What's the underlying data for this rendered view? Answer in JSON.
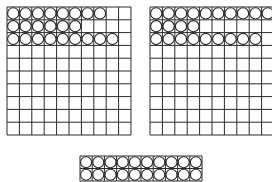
{
  "colors": {
    "line": "#2a2a2a",
    "circle_fill": "#ffffff",
    "background": "#ffffff"
  },
  "grids": [
    {
      "name": "left-hundred-grid",
      "x": 6,
      "y": 6,
      "cols": 10,
      "rows": 10,
      "cell_w": 12.4,
      "cell_h": 12.8,
      "filled_per_row": [
        8,
        6,
        9,
        0,
        0,
        0,
        0,
        0,
        0,
        0
      ]
    },
    {
      "name": "right-hundred-grid",
      "x": 149,
      "y": 6,
      "cols": 10,
      "rows": 10,
      "cell_w": 12.4,
      "cell_h": 12.8,
      "filled_per_row": [
        10,
        4,
        9,
        0,
        0,
        0,
        0,
        0,
        0,
        0
      ]
    },
    {
      "name": "bottom-twenty-strip",
      "x": 79,
      "y": 155,
      "cols": 10,
      "rows": 2,
      "cell_w": 12.2,
      "cell_h": 12.5,
      "filled_per_row": [
        10,
        10
      ]
    }
  ]
}
